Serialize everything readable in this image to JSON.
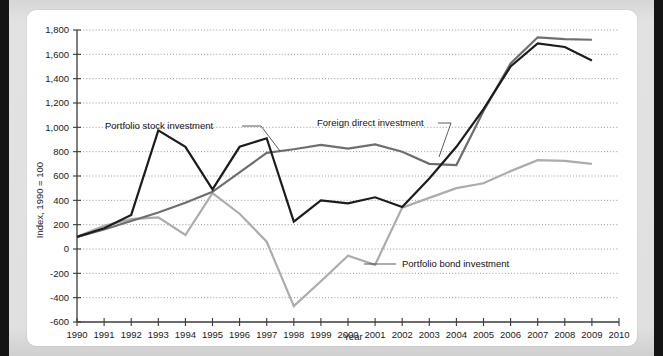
{
  "chart_data": {
    "type": "line",
    "title": "",
    "xlabel": "Year",
    "ylabel": "Index, 1990 = 100",
    "x": [
      1990,
      1991,
      1992,
      1993,
      1994,
      1995,
      1996,
      1997,
      1998,
      1999,
      2000,
      2001,
      2002,
      2003,
      2004,
      2005,
      2006,
      2007,
      2008,
      2009
    ],
    "xlim": [
      1990,
      2010
    ],
    "ylim": [
      -600,
      1800
    ],
    "ytick_labels": [
      "1,800",
      "1,600",
      "1,400",
      "1,200",
      "1,000",
      "800",
      "600",
      "400",
      "200",
      "0",
      "-200",
      "-400",
      "-600"
    ],
    "ytick_values": [
      1800,
      1600,
      1400,
      1200,
      1000,
      800,
      600,
      400,
      200,
      0,
      -200,
      -400,
      -600
    ],
    "xtick_labels": [
      "1990",
      "1991",
      "1992",
      "1993",
      "1994",
      "1995",
      "1996",
      "1997",
      "1998",
      "1999",
      "2000",
      "2001",
      "2002",
      "2003",
      "2004",
      "2005",
      "2006",
      "2007",
      "2008",
      "2009",
      "2010"
    ],
    "grid": true,
    "legend_position": "inline-annotations",
    "series": [
      {
        "name": "Portfolio stock investment",
        "color": "#1c1c1c",
        "values": [
          100,
          170,
          280,
          975,
          840,
          490,
          840,
          910,
          225,
          400,
          375,
          425,
          345,
          580,
          840,
          1150,
          1500,
          1690,
          1660,
          1550
        ]
      },
      {
        "name": "Foreign direct investment",
        "color": "#6e6e6e",
        "values": [
          100,
          160,
          230,
          300,
          380,
          470,
          630,
          790,
          820,
          855,
          825,
          860,
          800,
          700,
          690,
          1135,
          1525,
          1740,
          1725,
          1720
        ]
      },
      {
        "name": "Portfolio bond investment",
        "color": "#acacac",
        "values": [
          100,
          190,
          245,
          260,
          115,
          460,
          290,
          60,
          -470,
          -265,
          -55,
          -130,
          340,
          420,
          500,
          540,
          640,
          730,
          725,
          700
        ]
      }
    ],
    "annotations": [
      {
        "text": "Portfolio stock investment",
        "series": "Portfolio stock investment"
      },
      {
        "text": "Foreign direct investment",
        "series": "Foreign direct investment"
      },
      {
        "text": "Portfolio bond investment",
        "series": "Portfolio bond investment"
      }
    ]
  },
  "figure": {
    "ylabel": "Index, 1990 = 100",
    "xlabel": "Year"
  }
}
